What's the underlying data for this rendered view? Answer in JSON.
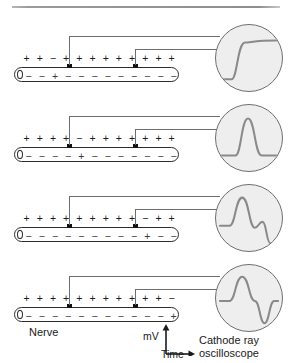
{
  "figure": {
    "title_rule": true,
    "labels": {
      "nerve": "Nerve",
      "mv": "mV",
      "time": "Time",
      "scope_line1": "Cathode ray",
      "scope_line2": "oscilloscope"
    },
    "colors": {
      "outline": "#2b2b2b",
      "wire": "#6d6d6d",
      "electrode": "#111111",
      "scope_face": "#eeeeee",
      "scope_border": "#6f6f6f",
      "trace": "#8a8a8a",
      "rule": "#9a9a9a"
    }
  },
  "panels": [
    {
      "id": "panel1",
      "outside_charges": [
        "+",
        "+",
        "−",
        "+",
        "+",
        "+",
        "+",
        "+",
        "+",
        "+",
        "+",
        "+"
      ],
      "inside_charges": [
        "−",
        "−",
        "+",
        "−",
        "−",
        "−",
        "−",
        "−",
        "−",
        "−",
        "−",
        "−"
      ],
      "electrode_left_x": 67,
      "electrode_right_x": 133,
      "trace_name": "rising-sigmoid",
      "trace_path": "M 6 56 L 16 56 C 22 56 22 18 30 18 C 36 18 40 16 62 16",
      "description": "Depolarisation reaches left electrode; trace rises in an S-curve."
    },
    {
      "id": "panel2",
      "outside_charges": [
        "+",
        "+",
        "+",
        "+",
        "−",
        "+",
        "+",
        "+",
        "+",
        "+",
        "+",
        "+"
      ],
      "inside_charges": [
        "−",
        "−",
        "−",
        "−",
        "+",
        "−",
        "−",
        "−",
        "−",
        "−",
        "−",
        "−"
      ],
      "electrode_left_x": 67,
      "electrode_right_x": 133,
      "trace_name": "single-peak",
      "trace_path": "M 6 52 L 20 52 C 26 52 26 14 33 14 C 40 14 40 52 47 52 L 62 52",
      "description": "Impulse between the electrodes; a single upward peak is recorded."
    },
    {
      "id": "panel3",
      "outside_charges": [
        "+",
        "+",
        "+",
        "+",
        "+",
        "+",
        "+",
        "+",
        "+",
        "−",
        "+",
        "+"
      ],
      "inside_charges": [
        "−",
        "−",
        "−",
        "−",
        "−",
        "−",
        "−",
        "−",
        "−",
        "+",
        "−",
        "−"
      ],
      "electrode_left_x": 67,
      "electrode_right_x": 133,
      "trace_name": "peak-then-step-down",
      "trace_path": "M 4 42 L 14 42 C 20 42 20 13 27 13 C 34 13 34 44 40 44 C 44 44 44 38 48 38 C 52 38 52 60 56 60 L 62 60",
      "description": "Depolarisation reaches right electrode; peak followed by a descending step."
    },
    {
      "id": "panel4",
      "outside_charges": [
        "+",
        "+",
        "+",
        "+",
        "+",
        "+",
        "+",
        "+",
        "+",
        "+",
        "+",
        "−"
      ],
      "inside_charges": [
        "−",
        "−",
        "−",
        "−",
        "−",
        "−",
        "−",
        "−",
        "−",
        "−",
        "−",
        "+"
      ],
      "electrode_left_x": 67,
      "electrode_right_x": 133,
      "trace_name": "biphasic",
      "trace_path": "M 4 37 L 14 37 C 20 37 20 12 27 12 C 34 12 34 37 40 37 C 45 37 45 60 50 60 C 55 60 55 37 60 37 L 64 37",
      "description": "Impulse has passed both electrodes; biphasic up-then-down trace."
    }
  ]
}
